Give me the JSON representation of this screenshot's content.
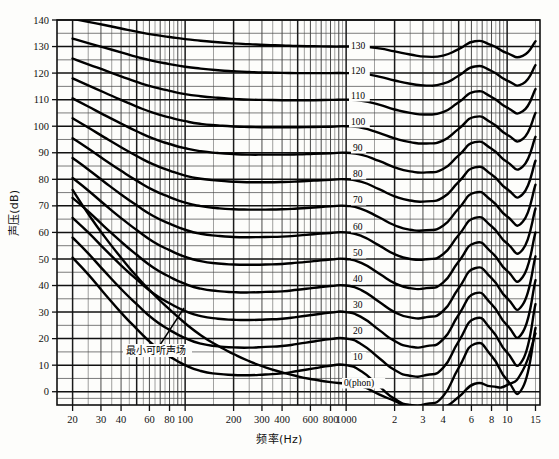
{
  "figure": {
    "background": "#fdfdfb",
    "line_color": "#000000",
    "grid_color": "#1a1a1a"
  },
  "chart_data": {
    "type": "line",
    "title": "",
    "subtitle": "",
    "xlabel": "频率(Hz)",
    "ylabel": "声压(dB)",
    "xscale": "log",
    "yscale": "linear",
    "xlim": [
      16,
      16000
    ],
    "ylim": [
      -5,
      140
    ],
    "grid": true,
    "grid_major_y_step": 10,
    "grid_minor_y_step": 5,
    "legend_position": "inline-right",
    "xtick_labels": [
      "20",
      "30",
      "40",
      "60",
      "80",
      "100",
      "200",
      "300",
      "400",
      "600",
      "800",
      "1000",
      "2",
      "3",
      "4",
      "6",
      "8",
      "10",
      "15"
    ],
    "xtick_values": [
      20,
      30,
      40,
      60,
      80,
      100,
      200,
      300,
      400,
      600,
      800,
      1000,
      2000,
      3000,
      4000,
      6000,
      8000,
      10000,
      15000
    ],
    "ytick_labels": [
      "0",
      "10",
      "20",
      "30",
      "40",
      "50",
      "60",
      "70",
      "80",
      "90",
      "100",
      "110",
      "120",
      "130",
      "140"
    ],
    "ytick_values": [
      0,
      10,
      20,
      30,
      40,
      50,
      60,
      70,
      80,
      90,
      100,
      110,
      120,
      130,
      140
    ],
    "annotations": [
      {
        "text": "最小可听声场",
        "x_px": 126,
        "y_px": 354,
        "leader_from_px": [
          158,
          348
        ],
        "leader_to_px": [
          184,
          308
        ]
      },
      {
        "text": "0(phon)",
        "x_px": 344,
        "y_px": 386
      }
    ],
    "series": [
      {
        "name": "130",
        "label": "130",
        "label_x_px": 351,
        "label_y_px": 49,
        "x": [
          20,
          25,
          31.5,
          40,
          50,
          63,
          80,
          100,
          125,
          160,
          200,
          250,
          315,
          400,
          500,
          630,
          800,
          1000,
          1250,
          1600,
          2000,
          2500,
          3150,
          4000,
          5000,
          6300,
          8000,
          10000,
          12500,
          15000
        ],
        "y": [
          140.5,
          139.3,
          138.1,
          136.8,
          135.6,
          134.5,
          133.6,
          132.8,
          132.2,
          131.6,
          131.2,
          130.9,
          130.6,
          130.4,
          130.2,
          130.1,
          130.0,
          130.0,
          130.0,
          129.3,
          128.2,
          127.0,
          126.2,
          126.6,
          129.0,
          132.0,
          130.5,
          127.5,
          126.5,
          132.0
        ]
      },
      {
        "name": "120",
        "label": "120",
        "label_x_px": 351,
        "label_y_px": 74,
        "x": [
          20,
          25,
          31.5,
          40,
          50,
          63,
          80,
          100,
          125,
          160,
          200,
          250,
          315,
          400,
          500,
          630,
          800,
          1000,
          1250,
          1600,
          2000,
          2500,
          3150,
          4000,
          5000,
          6300,
          8000,
          10000,
          12500,
          15000
        ],
        "y": [
          133.0,
          131.3,
          129.6,
          127.8,
          126.1,
          124.6,
          123.4,
          122.4,
          121.7,
          121.1,
          120.7,
          120.4,
          120.2,
          120.1,
          120.0,
          120.0,
          120.0,
          120.0,
          119.8,
          118.7,
          117.2,
          116.0,
          115.3,
          116.0,
          119.0,
          122.5,
          120.8,
          117.2,
          116.0,
          123.0
        ]
      },
      {
        "name": "110",
        "label": "110",
        "label_x_px": 351,
        "label_y_px": 99,
        "x": [
          20,
          25,
          31.5,
          40,
          50,
          63,
          80,
          100,
          125,
          160,
          200,
          250,
          315,
          400,
          500,
          630,
          800,
          1000,
          1250,
          1600,
          2000,
          2500,
          3150,
          4000,
          5000,
          6300,
          8000,
          10000,
          12500,
          15000
        ],
        "y": [
          125.5,
          123.3,
          121.1,
          118.8,
          116.7,
          114.8,
          113.3,
          112.1,
          111.3,
          110.7,
          110.3,
          110.0,
          109.9,
          109.8,
          109.8,
          109.8,
          109.9,
          110.0,
          109.6,
          108.1,
          106.3,
          105.0,
          104.4,
          105.3,
          109.0,
          113.0,
          111.0,
          107.0,
          105.6,
          114.0
        ]
      },
      {
        "name": "100",
        "label": "100",
        "label_x_px": 351,
        "label_y_px": 125,
        "x": [
          20,
          25,
          31.5,
          40,
          50,
          63,
          80,
          100,
          125,
          160,
          200,
          250,
          315,
          400,
          500,
          630,
          800,
          1000,
          1250,
          1600,
          2000,
          2500,
          3150,
          4000,
          5000,
          6300,
          8000,
          10000,
          12500,
          15000
        ],
        "y": [
          118.0,
          115.4,
          112.7,
          109.9,
          107.4,
          105.1,
          103.3,
          101.9,
          100.9,
          100.3,
          99.9,
          99.7,
          99.6,
          99.6,
          99.6,
          99.7,
          99.8,
          100.0,
          99.4,
          97.5,
          95.4,
          94.0,
          93.5,
          94.6,
          99.0,
          103.5,
          101.3,
          96.8,
          95.2,
          105.0
        ]
      },
      {
        "name": "90",
        "label": "90",
        "label_x_px": 353,
        "label_y_px": 151,
        "x": [
          20,
          25,
          31.5,
          40,
          50,
          63,
          80,
          100,
          125,
          160,
          200,
          250,
          315,
          400,
          500,
          630,
          800,
          1000,
          1250,
          1600,
          2000,
          2500,
          3150,
          4000,
          5000,
          6300,
          8000,
          10000,
          12500,
          15000
        ],
        "y": [
          110.5,
          107.4,
          104.2,
          101.0,
          98.1,
          95.4,
          93.3,
          91.7,
          90.6,
          89.9,
          89.5,
          89.3,
          89.3,
          89.3,
          89.4,
          89.6,
          89.8,
          90.0,
          89.2,
          86.9,
          84.5,
          83.0,
          82.6,
          83.9,
          89.0,
          94.0,
          91.5,
          86.5,
          84.8,
          96.0
        ]
      },
      {
        "name": "80",
        "label": "80",
        "label_x_px": 353,
        "label_y_px": 177,
        "x": [
          20,
          25,
          31.5,
          40,
          50,
          63,
          80,
          100,
          125,
          160,
          200,
          250,
          315,
          400,
          500,
          630,
          800,
          1000,
          1250,
          1600,
          2000,
          2500,
          3150,
          4000,
          5000,
          6300,
          8000,
          10000,
          12500,
          15000
        ],
        "y": [
          103.0,
          99.5,
          95.8,
          92.1,
          88.8,
          85.7,
          83.3,
          81.4,
          80.2,
          79.5,
          79.1,
          78.9,
          78.9,
          79.0,
          79.2,
          79.5,
          79.8,
          80.0,
          79.0,
          76.3,
          73.6,
          72.0,
          71.7,
          73.2,
          79.0,
          84.5,
          81.8,
          76.3,
          74.4,
          87.0
        ]
      },
      {
        "name": "70",
        "label": "70",
        "label_x_px": 353,
        "label_y_px": 203,
        "x": [
          20,
          25,
          31.5,
          40,
          50,
          63,
          80,
          100,
          125,
          160,
          200,
          250,
          315,
          400,
          500,
          630,
          800,
          1000,
          1250,
          1600,
          2000,
          2500,
          3150,
          4000,
          5000,
          6300,
          8000,
          10000,
          12500,
          15000
        ],
        "y": [
          95.5,
          91.6,
          87.4,
          83.2,
          79.5,
          76.0,
          73.3,
          71.2,
          69.9,
          69.1,
          68.7,
          68.6,
          68.6,
          68.7,
          69.0,
          69.4,
          69.8,
          70.0,
          68.8,
          65.7,
          62.7,
          61.0,
          60.8,
          62.5,
          69.0,
          75.0,
          72.0,
          66.0,
          64.0,
          78.0
        ]
      },
      {
        "name": "60",
        "label": "60",
        "label_x_px": 353,
        "label_y_px": 230,
        "x": [
          20,
          25,
          31.5,
          40,
          50,
          63,
          80,
          100,
          125,
          160,
          200,
          250,
          315,
          400,
          500,
          630,
          800,
          1000,
          1250,
          1600,
          2000,
          2500,
          3150,
          4000,
          5000,
          6300,
          8000,
          10000,
          12500,
          15000
        ],
        "y": [
          88.0,
          83.7,
          79.0,
          74.3,
          70.2,
          66.3,
          63.3,
          61.0,
          59.5,
          58.7,
          58.3,
          58.2,
          58.3,
          58.4,
          58.8,
          59.3,
          59.8,
          60.0,
          58.6,
          55.1,
          51.8,
          50.0,
          49.9,
          51.8,
          59.0,
          65.5,
          62.3,
          55.8,
          53.6,
          69.0
        ]
      },
      {
        "name": "50",
        "label": "50",
        "label_x_px": 353,
        "label_y_px": 256,
        "x": [
          20,
          25,
          31.5,
          40,
          50,
          63,
          80,
          100,
          125,
          160,
          200,
          250,
          315,
          400,
          500,
          630,
          800,
          1000,
          1250,
          1600,
          2000,
          2500,
          3150,
          4000,
          5000,
          6300,
          8000,
          10000,
          12500,
          15000
        ],
        "y": [
          80.5,
          75.8,
          70.6,
          65.4,
          60.9,
          56.6,
          53.3,
          50.8,
          49.2,
          48.3,
          47.9,
          47.8,
          47.9,
          48.1,
          48.6,
          49.2,
          49.8,
          50.0,
          48.4,
          44.5,
          40.9,
          39.0,
          39.0,
          41.1,
          49.0,
          56.0,
          52.5,
          45.5,
          43.2,
          60.0
        ]
      },
      {
        "name": "40",
        "label": "40",
        "label_x_px": 353,
        "label_y_px": 282,
        "x": [
          20,
          25,
          31.5,
          40,
          50,
          63,
          80,
          100,
          125,
          160,
          200,
          250,
          315,
          400,
          500,
          630,
          800,
          1000,
          1250,
          1600,
          2000,
          2500,
          3150,
          4000,
          5000,
          6300,
          8000,
          10000,
          12500,
          15000
        ],
        "y": [
          73.0,
          67.9,
          62.2,
          56.5,
          51.6,
          46.9,
          43.3,
          40.6,
          38.8,
          37.9,
          37.5,
          37.4,
          37.6,
          37.8,
          38.4,
          39.1,
          39.8,
          40.0,
          38.2,
          33.9,
          30.0,
          28.0,
          28.1,
          30.4,
          39.0,
          46.5,
          42.8,
          35.2,
          32.8,
          51.0
        ]
      },
      {
        "name": "30",
        "label": "30",
        "label_x_px": 353,
        "label_y_px": 308,
        "x": [
          20,
          25,
          31.5,
          40,
          50,
          63,
          80,
          100,
          125,
          160,
          200,
          250,
          315,
          400,
          500,
          630,
          800,
          1000,
          1250,
          1600,
          2000,
          2500,
          3150,
          4000,
          5000,
          6300,
          8000,
          10000,
          12500,
          15000
        ],
        "y": [
          65.5,
          60.0,
          53.8,
          47.6,
          42.3,
          37.2,
          33.3,
          30.4,
          28.5,
          27.5,
          27.1,
          27.0,
          27.2,
          27.5,
          28.2,
          29.0,
          29.8,
          30.0,
          28.0,
          23.3,
          19.1,
          17.0,
          17.2,
          19.7,
          29.0,
          37.0,
          33.0,
          25.0,
          22.4,
          42.0
        ]
      },
      {
        "name": "20",
        "label": "20",
        "label_x_px": 353,
        "label_y_px": 334,
        "x": [
          20,
          25,
          31.5,
          40,
          50,
          63,
          80,
          100,
          125,
          160,
          200,
          250,
          315,
          400,
          500,
          630,
          800,
          1000,
          1250,
          1600,
          2000,
          2500,
          3150,
          4000,
          5000,
          6300,
          8000,
          10000,
          12500,
          15000
        ],
        "y": [
          58.0,
          52.1,
          45.4,
          38.7,
          33.0,
          27.5,
          23.3,
          20.2,
          18.1,
          17.1,
          16.7,
          16.6,
          16.9,
          17.2,
          18.0,
          18.9,
          19.8,
          20.0,
          17.8,
          12.7,
          8.2,
          6.0,
          6.3,
          9.0,
          19.0,
          27.5,
          23.3,
          14.7,
          12.0,
          33.0
        ]
      },
      {
        "name": "10",
        "label": "10",
        "label_x_px": 353,
        "label_y_px": 360,
        "x": [
          20,
          25,
          31.5,
          40,
          50,
          63,
          80,
          100,
          125,
          160,
          200,
          250,
          315,
          400,
          500,
          630,
          800,
          1000,
          1250,
          1600,
          2000,
          2500,
          3150,
          4000,
          5000,
          6300,
          8000,
          10000,
          12500,
          15000
        ],
        "y": [
          50.5,
          44.2,
          37.0,
          29.8,
          23.7,
          17.8,
          13.3,
          10.0,
          7.8,
          6.7,
          6.3,
          6.2,
          6.5,
          6.9,
          7.8,
          8.8,
          9.8,
          10.0,
          7.6,
          2.1,
          -2.7,
          -5.0,
          -4.6,
          -1.7,
          9.0,
          18.0,
          13.5,
          4.4,
          1.6,
          24.0
        ]
      },
      {
        "name": "0",
        "label": "0(phon)",
        "label_x_px": 344,
        "label_y_px": 386,
        "x": [
          20,
          25,
          31.5,
          40,
          50,
          63,
          80,
          100,
          125,
          160,
          200,
          250,
          315,
          400,
          500,
          630,
          800,
          1000,
          1250,
          1600,
          2000,
          2500,
          3150,
          4000,
          5000,
          6300,
          8000,
          10000,
          12500,
          15000
        ],
        "y": [
          76.0,
          67.0,
          58.5,
          50.5,
          43.5,
          37.0,
          31.0,
          25.8,
          21.3,
          17.3,
          14.2,
          11.5,
          9.2,
          7.3,
          5.8,
          4.6,
          3.6,
          3.0,
          2.0,
          -1.0,
          -3.5,
          -6.0,
          -7.0,
          -6.0,
          -2.0,
          3.0,
          2.0,
          2.5,
          8.0,
          22.0
        ]
      }
    ]
  }
}
